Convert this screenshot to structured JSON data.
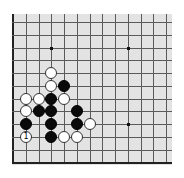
{
  "board": {
    "view": "partial lower-left region",
    "columns_visible": 13,
    "rows_visible": 12,
    "origin_x": 13,
    "origin_y": 22,
    "spacing": 12.75,
    "background_color": "#e3e3e3",
    "line_color": "#5a5a5a",
    "edges": [
      "left",
      "bottom"
    ],
    "star_points": [
      {
        "col": 3,
        "row": 2
      },
      {
        "col": 9,
        "row": 2
      },
      {
        "col": 9,
        "row": 8
      }
    ],
    "stones": [
      {
        "color": "white",
        "col": 3,
        "row": 4,
        "label": ""
      },
      {
        "color": "white",
        "col": 3,
        "row": 5,
        "label": ""
      },
      {
        "color": "black",
        "col": 4,
        "row": 5,
        "label": ""
      },
      {
        "color": "white",
        "col": 1,
        "row": 6,
        "label": ""
      },
      {
        "color": "white",
        "col": 2,
        "row": 6,
        "label": ""
      },
      {
        "color": "black",
        "col": 3,
        "row": 6,
        "label": ""
      },
      {
        "color": "white",
        "col": 4,
        "row": 6,
        "label": ""
      },
      {
        "color": "white",
        "col": 1,
        "row": 7,
        "label": ""
      },
      {
        "color": "black",
        "col": 2,
        "row": 7,
        "label": ""
      },
      {
        "color": "black",
        "col": 3,
        "row": 7,
        "label": ""
      },
      {
        "color": "black",
        "col": 5,
        "row": 7,
        "label": ""
      },
      {
        "color": "black",
        "col": 1,
        "row": 8,
        "label": ""
      },
      {
        "color": "black",
        "col": 3,
        "row": 8,
        "label": ""
      },
      {
        "color": "black",
        "col": 5,
        "row": 8,
        "label": ""
      },
      {
        "color": "white",
        "col": 6,
        "row": 8,
        "label": ""
      },
      {
        "color": "white",
        "col": 1,
        "row": 9,
        "label": "1"
      },
      {
        "color": "black",
        "col": 3,
        "row": 9,
        "label": ""
      },
      {
        "color": "white",
        "col": 4,
        "row": 9,
        "label": ""
      },
      {
        "color": "white",
        "col": 5,
        "row": 9,
        "label": ""
      }
    ]
  }
}
